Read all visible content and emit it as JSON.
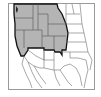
{
  "map": {
    "subject": "Western United States",
    "highlighted_region_label": "",
    "colors": {
      "background": "#ffffff",
      "frame": "#9a9a9a",
      "highlight_fill": "#b4b4b4",
      "highlight_outline": "#111111",
      "state_lines": "#6e6e6e",
      "ocean_inlet": "#222222"
    },
    "highlighted_states": [
      "Washington",
      "Oregon",
      "California (north)",
      "Idaho",
      "Nevada",
      "Montana",
      "Wyoming",
      "Utah",
      "Colorado"
    ]
  }
}
